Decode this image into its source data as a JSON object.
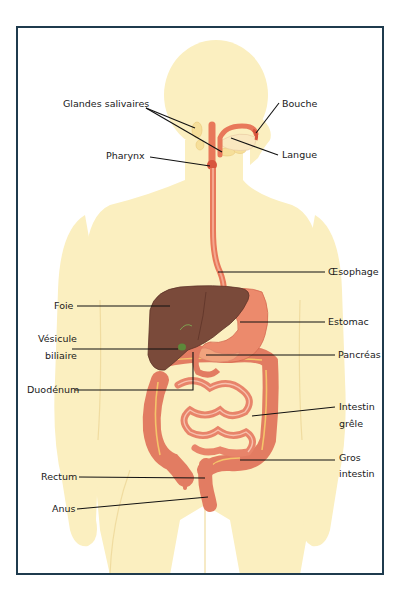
{
  "diagram": {
    "language": "fr",
    "frame_color": "#1f3b4d",
    "colors": {
      "skin": "#fbefc0",
      "skin_shadow": "#f3dea0",
      "liver": "#7a4a3a",
      "stomach": "#ec8a6c",
      "intestine": "#e27c62",
      "esophagus": "#e8785a",
      "gland": "#f6df9a",
      "leader": "#111111"
    },
    "labels": {
      "glandes_salivaires": "Glandes salivaires",
      "bouche": "Bouche",
      "pharynx": "Pharynx",
      "langue": "Langue",
      "oesophage": "Œsophage",
      "foie": "Foie",
      "estomac": "Estomac",
      "vesicule_1": "Vésicule",
      "vesicule_2": "biliaire",
      "pancreas": "Pancréas",
      "duodenum": "Duodénum",
      "intestin_grele_1": "Intestin",
      "intestin_grele_2": "grêle",
      "gros_intestin_1": "Gros",
      "gros_intestin_2": "intestin",
      "rectum": "Rectum",
      "anus": "Anus"
    }
  }
}
